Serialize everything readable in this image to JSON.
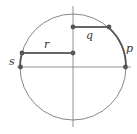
{
  "diagram": {
    "type": "unit-circle",
    "colors": {
      "stroke": "#555555",
      "thin": "#777777",
      "dot": "#555555",
      "background": "#ffffff"
    },
    "circle": {
      "cx": 73,
      "cy": 67,
      "r": 53
    },
    "axes": {
      "vertical": {
        "x": 73,
        "y1": 6,
        "y2": 127
      },
      "horizontal": {
        "y": 67,
        "x1": 17,
        "x2": 131
      }
    },
    "labels": {
      "p": "p",
      "q": "q",
      "r": "r",
      "s": "s"
    },
    "points": [
      {
        "id": "q-axis-end",
        "x": 73,
        "y": 27
      },
      {
        "id": "q-circle-end",
        "x": 109,
        "y": 27
      },
      {
        "id": "r-axis-end",
        "x": 73,
        "y": 53
      },
      {
        "id": "r-circle-end",
        "x": 22,
        "y": 53
      },
      {
        "id": "s-axis-point",
        "x": 21,
        "y": 67
      },
      {
        "id": "p-axis-point",
        "x": 126,
        "y": 67
      }
    ]
  }
}
